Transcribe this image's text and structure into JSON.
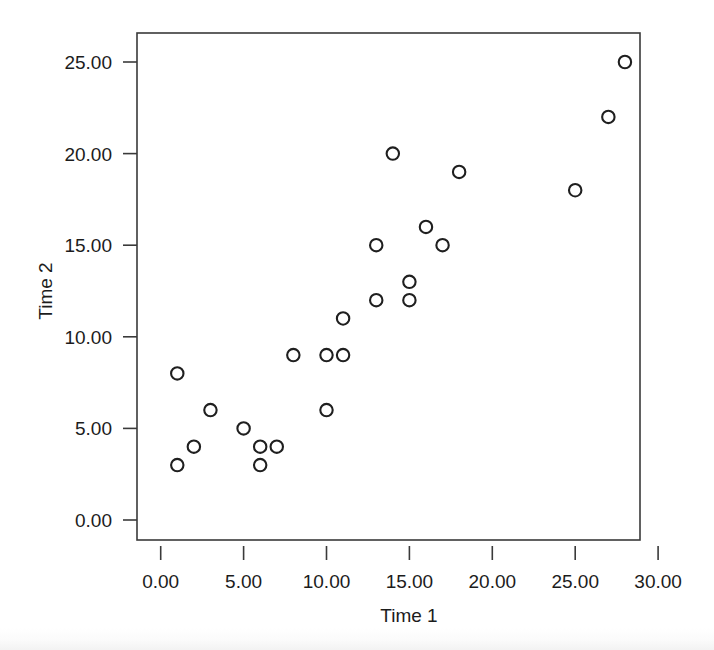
{
  "chart_data": {
    "type": "scatter",
    "title": "",
    "xlabel": "Time 1",
    "ylabel": "Time 2",
    "xlim": [
      -2.5,
      32.0
    ],
    "ylim": [
      -2.2,
      26.6
    ],
    "xticks": [
      0,
      5,
      10,
      15,
      20,
      25,
      30
    ],
    "xtick_labels": [
      "0.00",
      "5.00",
      "10.00",
      "15.00",
      "20.00",
      "25.00",
      "30.00"
    ],
    "yticks": [
      0,
      5,
      10,
      15,
      20,
      25
    ],
    "ytick_labels": [
      "0.00",
      "5.00",
      "10.00",
      "15.00",
      "20.00",
      "25.00"
    ],
    "grid": false,
    "legend": null,
    "marker": "open-circle",
    "marker_color": "#1f1f1f",
    "frame_color": "#3a3a3a",
    "background": "#ffffff",
    "x": [
      1,
      1,
      2,
      3,
      5,
      6,
      6,
      7,
      8,
      10,
      10,
      11,
      11,
      13,
      13,
      14,
      15,
      15,
      16,
      17,
      18,
      25,
      27,
      28
    ],
    "y": [
      8,
      3,
      4,
      6,
      5,
      4,
      3,
      4,
      9,
      9,
      6,
      9,
      11,
      15,
      12,
      20,
      13,
      12,
      16,
      15,
      19,
      18,
      22,
      25
    ],
    "points": [
      {
        "x": 1,
        "y": 8
      },
      {
        "x": 1,
        "y": 3
      },
      {
        "x": 2,
        "y": 4
      },
      {
        "x": 3,
        "y": 6
      },
      {
        "x": 5,
        "y": 5
      },
      {
        "x": 6,
        "y": 4
      },
      {
        "x": 6,
        "y": 3
      },
      {
        "x": 7,
        "y": 4
      },
      {
        "x": 8,
        "y": 9
      },
      {
        "x": 10,
        "y": 9
      },
      {
        "x": 10,
        "y": 6
      },
      {
        "x": 11,
        "y": 9
      },
      {
        "x": 11,
        "y": 11
      },
      {
        "x": 13,
        "y": 15
      },
      {
        "x": 13,
        "y": 12
      },
      {
        "x": 14,
        "y": 20
      },
      {
        "x": 15,
        "y": 13
      },
      {
        "x": 15,
        "y": 12
      },
      {
        "x": 16,
        "y": 16
      },
      {
        "x": 17,
        "y": 15
      },
      {
        "x": 18,
        "y": 19
      },
      {
        "x": 25,
        "y": 18
      },
      {
        "x": 27,
        "y": 22
      },
      {
        "x": 28,
        "y": 25
      }
    ]
  },
  "axes": {
    "x_axis_title": "Time 1",
    "y_axis_title": "Time 2"
  }
}
